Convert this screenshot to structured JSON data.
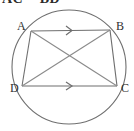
{
  "figure": {
    "caption": "AC = BD",
    "background_color": "#ffffff",
    "stroke_color": "#6f6f6f",
    "label_color": "#303030",
    "circle": {
      "name": "circumscribed-circle",
      "cx": 69,
      "cy": 67,
      "r": 57
    },
    "vertices": [
      {
        "id": "A",
        "label": "A",
        "x": 31,
        "y": 31,
        "label_x": 17,
        "label_y": 30
      },
      {
        "id": "B",
        "label": "B",
        "x": 110,
        "y": 30,
        "label_x": 116,
        "label_y": 30
      },
      {
        "id": "C",
        "label": "C",
        "x": 117,
        "y": 86,
        "label_x": 121,
        "label_y": 92
      },
      {
        "id": "D",
        "label": "D",
        "x": 22,
        "y": 86,
        "label_x": 10,
        "label_y": 92
      }
    ],
    "segments": [
      {
        "id": "AB",
        "from": "A",
        "to": "B",
        "x1": 31,
        "y1": 31,
        "x2": 110,
        "y2": 30,
        "marker": "single-chevron"
      },
      {
        "id": "BC",
        "from": "B",
        "to": "C",
        "x1": 110,
        "y1": 30,
        "x2": 117,
        "y2": 86,
        "marker": "none"
      },
      {
        "id": "DC",
        "from": "D",
        "to": "C",
        "x1": 22,
        "y1": 86,
        "x2": 117,
        "y2": 86,
        "marker": "single-chevron"
      },
      {
        "id": "AD",
        "from": "A",
        "to": "D",
        "x1": 31,
        "y1": 31,
        "x2": 22,
        "y2": 86,
        "marker": "none"
      },
      {
        "id": "AC",
        "from": "A",
        "to": "C",
        "x1": 31,
        "y1": 31,
        "x2": 117,
        "y2": 86,
        "marker": "none"
      },
      {
        "id": "BD",
        "from": "B",
        "to": "D",
        "x1": 110,
        "y1": 30,
        "x2": 22,
        "y2": 86,
        "marker": "none"
      }
    ],
    "parallel_marks": [
      {
        "id": "mark-ab",
        "on": "AB",
        "x": 70,
        "y": 30,
        "glyph": ">"
      },
      {
        "id": "mark-dc",
        "on": "DC",
        "x": 70,
        "y": 86,
        "glyph": ">"
      }
    ]
  }
}
